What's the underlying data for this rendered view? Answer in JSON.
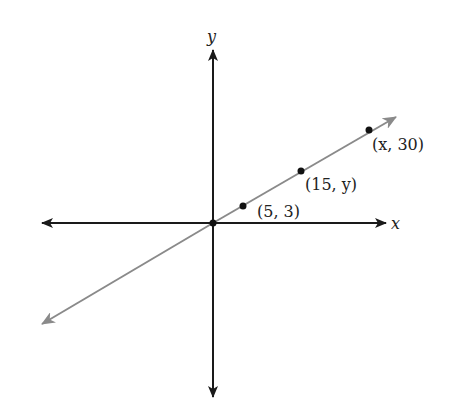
{
  "diagram": {
    "type": "coordinate-plane-line-through-origin",
    "axes": {
      "x_label": "x",
      "y_label": "y"
    },
    "line_color": "#8a8a8a",
    "axis_color": "#1a1a1a",
    "points": [
      {
        "label": "(5, 3)",
        "px": 243,
        "py": 206
      },
      {
        "label": "(15, y)",
        "px": 301,
        "py": 171
      },
      {
        "label": "(x, 30)",
        "px": 369,
        "py": 130
      }
    ],
    "origin": {
      "px": 213,
      "py": 223
    }
  }
}
